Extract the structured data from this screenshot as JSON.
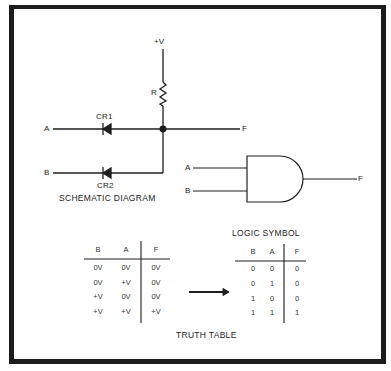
{
  "schematic": {
    "supply_label": "+V",
    "resistor_label": "R",
    "diode1_label": "CR1",
    "diode2_label": "CR2",
    "input_a_label": "A",
    "input_b_label": "B",
    "output_label": "F",
    "caption": "SCHEMATIC DIAGRAM"
  },
  "logic_symbol": {
    "input_a_label": "A",
    "input_b_label": "B",
    "output_label": "F",
    "gate_type": "AND",
    "caption": "LOGIC SYMBOL"
  },
  "voltage_table": {
    "headers": [
      "B",
      "A",
      "F"
    ],
    "rows": [
      [
        "0V",
        "0V",
        "0V"
      ],
      [
        "0V",
        "+V",
        "0V"
      ],
      [
        "+V",
        "0V",
        "0V"
      ],
      [
        "+V",
        "+V",
        "+V"
      ]
    ]
  },
  "binary_table": {
    "headers": [
      "B",
      "A",
      "F"
    ],
    "rows": [
      [
        "0",
        "0",
        "0"
      ],
      [
        "0",
        "1",
        "0"
      ],
      [
        "1",
        "0",
        "0"
      ],
      [
        "1",
        "1",
        "1"
      ]
    ]
  },
  "truth_table_caption": "TRUTH TABLE"
}
